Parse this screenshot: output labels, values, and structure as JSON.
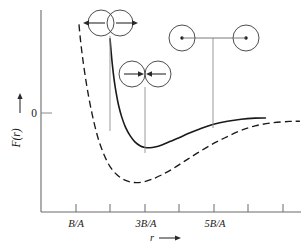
{
  "figure": {
    "type": "potential-energy-curve",
    "background_color": "#ffffff",
    "line_color": "#1a1a1a",
    "axis_color": "#555555"
  },
  "axes": {
    "y_axis": {
      "label": "F(r)",
      "label_arrow": "up",
      "zero_label": "0",
      "x_px": 41,
      "top_px": 10,
      "bottom_px": 212,
      "zero_y_px": 113
    },
    "x_axis": {
      "label": "r",
      "label_arrow": "right",
      "y_px": 212,
      "left_px": 41,
      "right_px": 300,
      "tick_positions_px": [
        76,
        110,
        145,
        179,
        214,
        248,
        283
      ],
      "tick_labels": [
        {
          "text": "B/A",
          "x_px": 76
        },
        {
          "text": "3B/A",
          "x_px": 145
        },
        {
          "text": "5B/A",
          "x_px": 214
        }
      ]
    }
  },
  "chart_data": {
    "type": "line",
    "title": "",
    "xlabel": "r",
    "ylabel": "F(r)",
    "xlim": [
      0,
      7.5
    ],
    "ylim": [
      -1.0,
      1.0
    ],
    "grid": false,
    "legend": "none",
    "x_tick_values": [
      1,
      2,
      3,
      4,
      5,
      6,
      7
    ],
    "x_tick_labels": [
      "B/A",
      "",
      "3B/A",
      "",
      "5B/A",
      "",
      ""
    ],
    "y_tick_values": [
      0
    ],
    "y_tick_labels": [
      "0"
    ],
    "series": [
      {
        "name": "solid-curve",
        "style": "solid",
        "color": "#1a1a1a",
        "x": [
          2.0,
          2.03,
          2.07,
          2.12,
          2.18,
          2.25,
          2.34,
          2.45,
          2.58,
          2.72,
          2.88,
          3.02,
          3.15,
          3.3,
          3.5,
          3.75,
          4.0,
          4.3,
          4.6,
          5.0,
          5.4,
          5.8,
          6.2,
          6.5
        ],
        "y": [
          0.72,
          0.6,
          0.46,
          0.32,
          0.19,
          0.07,
          -0.04,
          -0.14,
          -0.22,
          -0.28,
          -0.32,
          -0.335,
          -0.337,
          -0.33,
          -0.31,
          -0.275,
          -0.24,
          -0.195,
          -0.155,
          -0.11,
          -0.08,
          -0.06,
          -0.05,
          -0.048
        ]
      },
      {
        "name": "dashed-curve",
        "style": "dashed",
        "color": "#1a1a1a",
        "x": [
          1.1,
          1.14,
          1.2,
          1.28,
          1.38,
          1.5,
          1.65,
          1.82,
          2.0,
          2.2,
          2.45,
          2.7,
          2.95,
          3.2,
          3.5,
          3.8,
          4.15,
          4.5,
          4.9,
          5.3,
          5.75,
          6.2,
          6.7,
          7.2,
          7.5
        ],
        "y": [
          0.86,
          0.72,
          0.55,
          0.36,
          0.16,
          -0.04,
          -0.24,
          -0.4,
          -0.52,
          -0.6,
          -0.655,
          -0.675,
          -0.67,
          -0.645,
          -0.6,
          -0.545,
          -0.47,
          -0.395,
          -0.315,
          -0.245,
          -0.175,
          -0.125,
          -0.095,
          -0.082,
          -0.08
        ]
      }
    ],
    "annotations": [
      {
        "name": "overlapping-atoms-repulsive",
        "description": "Two overlapping circles with outward arrows indicating repulsion",
        "drop_line_x_px": 110,
        "drop_line_to_y_px": 131
      },
      {
        "name": "touching-atoms-equilibrium",
        "description": "Two touching circles with inward arrows indicating attraction at minimum",
        "drop_line_x_px": 145,
        "drop_line_to_y_px": 152
      },
      {
        "name": "separated-atoms-far",
        "description": "Two separated circles with center dots joined by a bond line",
        "drop_line_x_px": 213,
        "drop_line_to_y_px": 128
      }
    ]
  },
  "diagrams": {
    "repulsive_pair": {
      "name": "overlapping-atom-pair",
      "circle_left_cx_px": 101,
      "circle_right_cx_px": 120,
      "circle_cy_px": 23,
      "circle_r_px": 13,
      "arrow_left_label": "outward-arrow-left",
      "arrow_right_label": "outward-arrow-right"
    },
    "equilibrium_pair": {
      "name": "touching-atom-pair",
      "circle_left_cx_px": 132,
      "circle_right_cx_px": 158,
      "circle_cy_px": 74,
      "circle_r_px": 13,
      "arrow_left_label": "inward-arrow-right",
      "arrow_right_label": "inward-arrow-left"
    },
    "separated_pair": {
      "name": "separated-atom-pair",
      "circle_left_cx_px": 182,
      "circle_right_cx_px": 246,
      "circle_cy_px": 38,
      "circle_r_px": 13,
      "bond_label": "bond-line",
      "dot_r_px": 1.6
    }
  }
}
